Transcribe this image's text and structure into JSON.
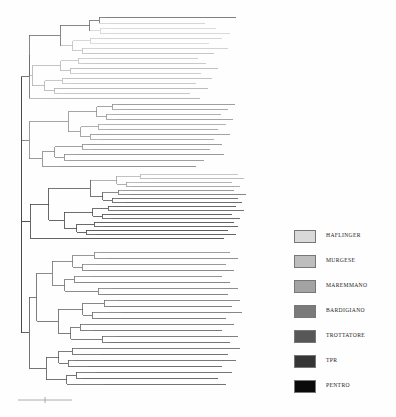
{
  "figure": {
    "type": "phylogenetic-tree",
    "orientation": "rectangular-horizontal",
    "background_color": "#fefefe"
  },
  "legend": {
    "position": "right",
    "items": [
      {
        "label": "HAFLINGER",
        "color": "#d9d9d9"
      },
      {
        "label": "MURGESE",
        "color": "#bdbdbd"
      },
      {
        "label": "MAREMMANO",
        "color": "#a3a3a3"
      },
      {
        "label": "BARDIGIANO",
        "color": "#7a7a7a"
      },
      {
        "label": "TROTTATORE",
        "color": "#575757"
      },
      {
        "label": "TPR",
        "color": "#353535"
      },
      {
        "label": "PENTRO",
        "color": "#0a0a0a"
      }
    ]
  },
  "scalebar": {
    "visible": true,
    "label": "",
    "color": "#9a9a9a"
  },
  "chart_data": {
    "type": "tree",
    "title": "",
    "xlabel": "",
    "ylabel": "",
    "grid": false,
    "legend_position": "right",
    "root_x": 21,
    "tip_area": [
      28,
      248
    ],
    "groups": [
      {
        "name": "HAFLINGER",
        "color": "#d9d9d9",
        "tip_count": 21
      },
      {
        "name": "MURGESE",
        "color": "#bdbdbd",
        "tip_count": 17
      },
      {
        "name": "MAREMMANO",
        "color": "#a3a3a3",
        "tip_count": 18
      },
      {
        "name": "BARDIGIANO",
        "color": "#7a7a7a",
        "tip_count": 20
      },
      {
        "name": "TROTTATORE",
        "color": "#575757",
        "tip_count": 19
      },
      {
        "name": "TPR",
        "color": "#353535",
        "tip_count": 16
      },
      {
        "name": "PENTRO",
        "color": "#0a0a0a",
        "tip_count": 14
      }
    ],
    "clades": [
      {
        "id": "clade-top",
        "y_range": [
          14,
          100
        ],
        "dominant_group": "HAFLINGER"
      },
      {
        "id": "clade-upper",
        "y_range": [
          104,
          168
        ],
        "dominant_group": "MURGESE"
      },
      {
        "id": "clade-middle",
        "y_range": [
          172,
          240
        ],
        "dominant_group": "TROTTATORE"
      },
      {
        "id": "clade-lower",
        "y_range": [
          248,
          392
        ],
        "dominant_group": "BARDIGIANO"
      }
    ],
    "tips": [
      {
        "y": 17,
        "x0": 105,
        "x1": 236,
        "color": "#6a6a6a"
      },
      {
        "y": 23,
        "x0": 110,
        "x1": 205,
        "color": "#cfcfcf"
      },
      {
        "y": 28,
        "x0": 113,
        "x1": 216,
        "color": "#d4d4d4"
      },
      {
        "y": 33,
        "x0": 106,
        "x1": 230,
        "color": "#d2d2d2"
      },
      {
        "y": 38,
        "x0": 99,
        "x1": 222,
        "color": "#cdcdcd"
      },
      {
        "y": 43,
        "x0": 96,
        "x1": 209,
        "color": "#d6d6d6"
      },
      {
        "y": 48,
        "x0": 102,
        "x1": 228,
        "color": "#cacaca"
      },
      {
        "y": 53,
        "x0": 88,
        "x1": 214,
        "color": "#bdbdbd"
      },
      {
        "y": 58,
        "x0": 93,
        "x1": 198,
        "color": "#c6c6c6"
      },
      {
        "y": 63,
        "x0": 84,
        "x1": 206,
        "color": "#c0c0c0"
      },
      {
        "y": 68,
        "x0": 76,
        "x1": 218,
        "color": "#b5b5b5"
      },
      {
        "y": 73,
        "x0": 80,
        "x1": 201,
        "color": "#c4c4c4"
      },
      {
        "y": 78,
        "x0": 68,
        "x1": 212,
        "color": "#b9b9b9"
      },
      {
        "y": 83,
        "x0": 72,
        "x1": 196,
        "color": "#c2c2c2"
      },
      {
        "y": 88,
        "x0": 60,
        "x1": 208,
        "color": "#b0b0b0"
      },
      {
        "y": 93,
        "x0": 64,
        "x1": 190,
        "color": "#bcbcbc"
      },
      {
        "y": 98,
        "x0": 55,
        "x1": 200,
        "color": "#adadad"
      },
      {
        "y": 104,
        "x0": 118,
        "x1": 235,
        "color": "#8e8e8e"
      },
      {
        "y": 109,
        "x0": 122,
        "x1": 228,
        "color": "#9a9a9a"
      },
      {
        "y": 114,
        "x0": 112,
        "x1": 221,
        "color": "#a2a2a2"
      },
      {
        "y": 119,
        "x0": 116,
        "x1": 233,
        "color": "#969696"
      },
      {
        "y": 124,
        "x0": 104,
        "x1": 226,
        "color": "#a6a6a6"
      },
      {
        "y": 129,
        "x0": 108,
        "x1": 218,
        "color": "#9e9e9e"
      },
      {
        "y": 134,
        "x0": 96,
        "x1": 230,
        "color": "#929292"
      },
      {
        "y": 139,
        "x0": 100,
        "x1": 214,
        "color": "#a0a0a0"
      },
      {
        "y": 144,
        "x0": 88,
        "x1": 222,
        "color": "#8a8a8a"
      },
      {
        "y": 149,
        "x0": 92,
        "x1": 210,
        "color": "#989898"
      },
      {
        "y": 154,
        "x0": 78,
        "x1": 224,
        "color": "#868686"
      },
      {
        "y": 160,
        "x0": 70,
        "x1": 204,
        "color": "#8e8e8e"
      },
      {
        "y": 166,
        "x0": 62,
        "x1": 196,
        "color": "#828282"
      },
      {
        "y": 174,
        "x0": 146,
        "x1": 238,
        "color": "#bdbdbd"
      },
      {
        "y": 178,
        "x0": 152,
        "x1": 244,
        "color": "#b2b2b2"
      },
      {
        "y": 182,
        "x0": 140,
        "x1": 232,
        "color": "#a8a8a8"
      },
      {
        "y": 186,
        "x0": 132,
        "x1": 240,
        "color": "#9c9c9c"
      },
      {
        "y": 190,
        "x0": 124,
        "x1": 234,
        "color": "#8a8a8a"
      },
      {
        "y": 194,
        "x0": 130,
        "x1": 246,
        "color": "#6e6e6e"
      },
      {
        "y": 198,
        "x0": 118,
        "x1": 238,
        "color": "#5c5c5c"
      },
      {
        "y": 202,
        "x0": 126,
        "x1": 242,
        "color": "#545454"
      },
      {
        "y": 206,
        "x0": 114,
        "x1": 236,
        "color": "#4e4e4e"
      },
      {
        "y": 210,
        "x0": 120,
        "x1": 244,
        "color": "#5a5a5a"
      },
      {
        "y": 214,
        "x0": 108,
        "x1": 232,
        "color": "#4a4a4a"
      },
      {
        "y": 218,
        "x0": 112,
        "x1": 240,
        "color": "#525252"
      },
      {
        "y": 222,
        "x0": 100,
        "x1": 234,
        "color": "#464646"
      },
      {
        "y": 226,
        "x0": 104,
        "x1": 238,
        "color": "#4e4e4e"
      },
      {
        "y": 230,
        "x0": 92,
        "x1": 228,
        "color": "#424242"
      },
      {
        "y": 234,
        "x0": 96,
        "x1": 236,
        "color": "#4a4a4a"
      },
      {
        "y": 238,
        "x0": 84,
        "x1": 224,
        "color": "#3e3e3e"
      },
      {
        "y": 252,
        "x0": 100,
        "x1": 230,
        "color": "#8c8c8c"
      },
      {
        "y": 258,
        "x0": 108,
        "x1": 238,
        "color": "#7e7e7e"
      },
      {
        "y": 264,
        "x0": 96,
        "x1": 226,
        "color": "#868686"
      },
      {
        "y": 270,
        "x0": 88,
        "x1": 234,
        "color": "#767676"
      },
      {
        "y": 276,
        "x0": 92,
        "x1": 222,
        "color": "#828282"
      },
      {
        "y": 282,
        "x0": 80,
        "x1": 230,
        "color": "#727272"
      },
      {
        "y": 288,
        "x0": 112,
        "x1": 238,
        "color": "#7a7a7a"
      },
      {
        "y": 294,
        "x0": 104,
        "x1": 228,
        "color": "#6e6e6e"
      },
      {
        "y": 300,
        "x0": 118,
        "x1": 240,
        "color": "#767676"
      },
      {
        "y": 306,
        "x0": 110,
        "x1": 232,
        "color": "#6a6a6a"
      },
      {
        "y": 312,
        "x0": 122,
        "x1": 242,
        "color": "#727272"
      },
      {
        "y": 318,
        "x0": 98,
        "x1": 226,
        "color": "#666666"
      },
      {
        "y": 324,
        "x0": 86,
        "x1": 234,
        "color": "#6e6e6e"
      },
      {
        "y": 330,
        "x0": 94,
        "x1": 222,
        "color": "#626262"
      },
      {
        "y": 336,
        "x0": 116,
        "x1": 238,
        "color": "#6a6a6a"
      },
      {
        "y": 342,
        "x0": 108,
        "x1": 230,
        "color": "#5e5e5e"
      },
      {
        "y": 348,
        "x0": 78,
        "x1": 240,
        "color": "#666666"
      },
      {
        "y": 354,
        "x0": 100,
        "x1": 228,
        "color": "#5a5a5a"
      },
      {
        "y": 360,
        "x0": 74,
        "x1": 236,
        "color": "#626262"
      },
      {
        "y": 366,
        "x0": 88,
        "x1": 222,
        "color": "#565656"
      },
      {
        "y": 372,
        "x0": 96,
        "x1": 232,
        "color": "#5e5e5e"
      },
      {
        "y": 378,
        "x0": 82,
        "x1": 218,
        "color": "#525252"
      },
      {
        "y": 384,
        "x0": 104,
        "x1": 226,
        "color": "#5a5a5a"
      }
    ]
  }
}
